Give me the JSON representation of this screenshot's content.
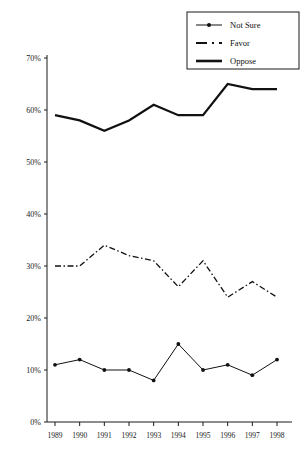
{
  "chart_data": {
    "type": "line",
    "title": "",
    "subtitle": "",
    "xlabel": "",
    "ylabel": "",
    "categories": [
      "1989",
      "1990",
      "1991",
      "1992",
      "1993",
      "1994",
      "1995",
      "1996",
      "1997",
      "1998"
    ],
    "x": [
      1989,
      1990,
      1991,
      1992,
      1993,
      1994,
      1995,
      1996,
      1997,
      1998
    ],
    "ylim": [
      0,
      70
    ],
    "ytick_values": [
      0,
      10,
      20,
      30,
      40,
      50,
      60,
      70
    ],
    "ytick_labels": [
      "0%",
      "10%",
      "20%",
      "30%",
      "40%",
      "50%",
      "60%",
      "70%"
    ],
    "grid": false,
    "legend_position": "top-right",
    "series": [
      {
        "name": "Not Sure",
        "style": "solid-with-markers",
        "values": [
          11,
          12,
          10,
          10,
          8,
          15,
          10,
          11,
          9,
          12
        ]
      },
      {
        "name": "Favor",
        "style": "dash-dot",
        "values": [
          30,
          30,
          34,
          32,
          31,
          26,
          31,
          24,
          27,
          24
        ]
      },
      {
        "name": "Oppose",
        "style": "thick-solid",
        "values": [
          59,
          58,
          56,
          58,
          61,
          59,
          59,
          65,
          64,
          64
        ]
      }
    ]
  },
  "legend": {
    "items": [
      {
        "label": "Not Sure",
        "marker": "line-with-dot"
      },
      {
        "label": "Favor",
        "marker": "dash-dot-line"
      },
      {
        "label": "Oppose",
        "marker": "thick-line"
      }
    ]
  }
}
